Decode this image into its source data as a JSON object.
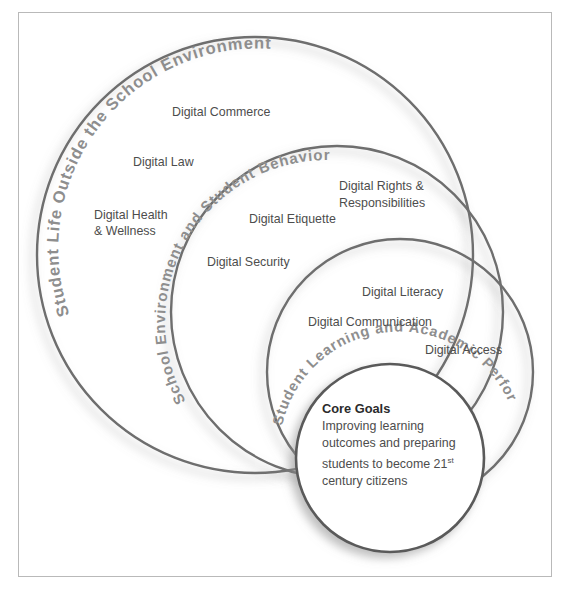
{
  "diagram": {
    "type": "nested-venn-circles",
    "title_present": false,
    "rings": [
      {
        "id": "ring-outer",
        "curved_label": "Student Life Outside the School Environment",
        "items": [
          "Digital Commerce",
          "Digital Law",
          "Digital Health & Wellness"
        ]
      },
      {
        "id": "ring-second",
        "curved_label": "School Environment and Student Behavior",
        "items": [
          "Digital Rights & Responsibilities",
          "Digital Etiquette",
          "Digital Security"
        ]
      },
      {
        "id": "ring-third",
        "curved_label": "Student Learning and Academic Performance",
        "items": [
          "Digital Literacy",
          "Digital Communication",
          "Digital Access"
        ]
      },
      {
        "id": "ring-core",
        "title": "Core Goals",
        "body_line_1": "Improving learning",
        "body_line_2": "outcomes and preparing",
        "body_line_3_a": "students to become 21",
        "body_line_3_sup": "st",
        "body_line_4": "century citizens"
      }
    ],
    "labels": {
      "digital_commerce": "Digital Commerce",
      "digital_law": "Digital Law",
      "digital_health_1": "Digital Health",
      "digital_health_2": "& Wellness",
      "digital_rights_1": "Digital Rights &",
      "digital_rights_2": "Responsibilities",
      "digital_etiquette": "Digital Etiquette",
      "digital_security": "Digital Security",
      "digital_literacy": "Digital Literacy",
      "digital_communication": "Digital Communication",
      "digital_access": "Digital Access"
    },
    "curved": {
      "outer": "Student Life Outside the School Environment",
      "second": "School Environment and Student Behavior",
      "third": "Student Learning and Academic Performance"
    },
    "core": {
      "title": "Core Goals",
      "line1": "Improving learning",
      "line2": "outcomes and preparing",
      "line3": "students to become 21",
      "line3_sup": "st",
      "line4": "century citizens"
    },
    "colors": {
      "stroke": "#6e6e6e",
      "curved_label_text": "#8e8e8e",
      "flat_label_text": "#4d4d4d",
      "core_title_text": "#2b2b2b",
      "frame_border": "#b9b9b9",
      "background": "#ffffff"
    }
  }
}
